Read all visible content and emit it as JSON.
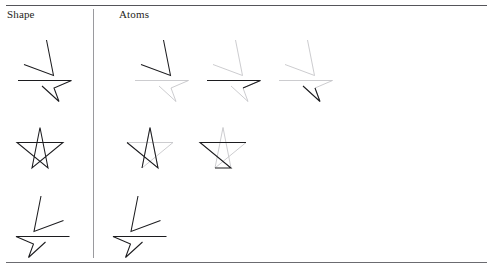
{
  "figure": {
    "columns": [
      {
        "id": "shape",
        "label": "Shape"
      },
      {
        "id": "atoms",
        "label": "Atoms"
      }
    ],
    "colors": {
      "rule": "#55555a",
      "divider": "#9a9a9e",
      "stroke_dark": "#1c1c1f",
      "stroke_mid": "#3a3a3e",
      "stroke_light": "#c3c3c6",
      "background": "#ffffff",
      "text": "#1e1e22"
    },
    "rows": [
      {
        "id": "row-1",
        "shape_name": "four-point-dart-star-right",
        "atom_count": 3,
        "shape": {
          "parts": [
            {
              "name": "upper-triangle",
              "tone": "dark",
              "points": "30.5,2.0 37.5,37.5 8.0,26.5"
            },
            {
              "name": "lower-dart",
              "tone": "dark",
              "points": "2.0,42.5 55.5,42.5 38.0,50.0 43.0,63.5 26.0,48.0"
            }
          ]
        },
        "atoms": [
          {
            "name": "atom-upper-triangle",
            "parts": [
              {
                "name": "upper-triangle",
                "tone": "dark",
                "points": "30.5,2.0 37.5,37.5 8.0,26.5"
              },
              {
                "name": "lower-dart",
                "tone": "light",
                "points": "2.0,42.5 55.5,42.5 38.0,50.0 43.0,63.5 26.0,48.0"
              }
            ]
          },
          {
            "name": "atom-dart-top-edge",
            "parts": [
              {
                "name": "upper-triangle",
                "tone": "light",
                "points": "30.5,2.0 37.5,37.5 8.0,26.5"
              },
              {
                "name": "lower-dart-rest",
                "tone": "light",
                "points": "2.0,42.5 55.5,42.5 38.0,50.0 43.0,63.5 26.0,48.0"
              },
              {
                "name": "lower-dart-top-edge",
                "tone": "dark",
                "points": "2.0,42.5 55.5,42.5 38.0,50.0"
              }
            ]
          },
          {
            "name": "atom-dart-lower-spike",
            "parts": [
              {
                "name": "upper-triangle",
                "tone": "light",
                "points": "30.5,2.0 37.5,37.5 8.0,26.5"
              },
              {
                "name": "lower-dart-rest",
                "tone": "light",
                "points": "2.0,42.5 55.5,42.5 38.0,50.0 43.0,63.5 26.0,48.0"
              },
              {
                "name": "lower-dart-spike-edge",
                "tone": "dark",
                "points": "26.0,48.0 43.0,63.5 38.0,50.0"
              }
            ]
          }
        ]
      },
      {
        "id": "row-2",
        "shape_name": "five-point-pentagram-star",
        "atom_count": 2,
        "shape": {
          "parts": [
            {
              "name": "pentagram",
              "tone": "dark",
              "points": "24.0,1.5 32.0,42.0 1.0,16.5 47.0,16.5 16.0,42.0 24.0,1.5"
            }
          ]
        },
        "atoms": [
          {
            "name": "atom-star-right-chevron",
            "parts": [
              {
                "name": "pentagram-rest",
                "tone": "light",
                "points": "24.0,1.5 32.0,42.0 1.0,16.5 47.0,16.5 16.0,42.0 24.0,1.5"
              },
              {
                "name": "star-right-chevron",
                "tone": "dark",
                "points": "16.0,42.0 24.0,1.5 32.0,42.0 1.0,16.5"
              }
            ]
          },
          {
            "name": "atom-star-left-chevron",
            "parts": [
              {
                "name": "pentagram-rest",
                "tone": "light",
                "points": "24.0,1.5 32.0,42.0 1.0,16.5 47.0,16.5 16.0,42.0 24.0,1.5"
              },
              {
                "name": "star-left-chevron",
                "tone": "dark",
                "points": "47.0,16.5 1.0,16.5 32.0,42.0 16.0,42.0"
              }
            ]
          }
        ]
      },
      {
        "id": "row-3",
        "shape_name": "four-point-dart-star-left-mirrored",
        "atom_count": 1,
        "shape": {
          "parts": [
            {
              "name": "upper-triangle",
              "tone": "dark",
              "points": "25.0,2.0 18.0,37.5 47.5,26.5"
            },
            {
              "name": "lower-dart",
              "tone": "dark",
              "points": "53.5,42.5 0.0,42.5 17.5,50.0 12.5,63.5 29.5,48.0"
            }
          ]
        },
        "atoms": [
          {
            "name": "atom-whole-shape",
            "parts": [
              {
                "name": "upper-triangle",
                "tone": "dark",
                "points": "25.0,2.0 18.0,37.5 47.5,26.5"
              },
              {
                "name": "lower-dart",
                "tone": "dark",
                "points": "53.5,42.5 0.0,42.5 17.5,50.0 12.5,63.5 29.5,48.0"
              }
            ]
          }
        ]
      }
    ],
    "layout": {
      "row_tops": [
        38,
        126,
        194
      ],
      "shape_cell_left": 16,
      "atom_cell_lefts": [
        [
          133,
          205,
          277
        ],
        [
          126,
          199
        ],
        [
          113
        ]
      ],
      "cell_sizes": {
        "row-1": {
          "w": 60,
          "h": 68
        },
        "row-2": {
          "w": 50,
          "h": 46
        },
        "row-3": {
          "w": 58,
          "h": 68
        }
      }
    }
  }
}
